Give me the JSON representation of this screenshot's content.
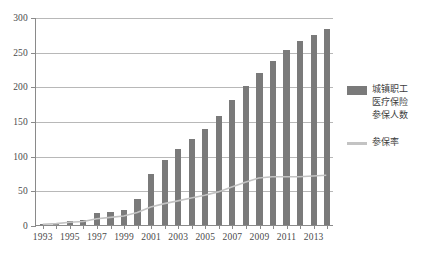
{
  "chart_data": {
    "type": "bar",
    "title": "",
    "subtitle": "",
    "xlabel": "",
    "ylabel": "",
    "ylim": [
      0,
      300
    ],
    "yticks": [
      0,
      50,
      100,
      150,
      200,
      250,
      300
    ],
    "ytick_labels": [
      "0",
      "50",
      "100",
      "150",
      "200",
      "250",
      "300"
    ],
    "grid": true,
    "legend_position": "right",
    "categories": [
      "1993",
      "1994",
      "1995",
      "1996",
      "1997",
      "1998",
      "1999",
      "2000",
      "2001",
      "2002",
      "2003",
      "2004",
      "2005",
      "2006",
      "2007",
      "2008",
      "2009",
      "2010",
      "2011",
      "2012",
      "2013",
      "2014"
    ],
    "xtick_labels_shown": [
      "1993",
      "1995",
      "1997",
      "1999",
      "2001",
      "2003",
      "2005",
      "2007",
      "2009",
      "2011",
      "2013"
    ],
    "series": [
      {
        "name": "城镇职工医疗保险参保人数",
        "type": "bar",
        "color": "#7a7a7a",
        "axis": "left",
        "values": [
          2,
          3,
          6,
          7,
          18,
          19,
          21,
          38,
          73,
          94,
          109,
          124,
          138,
          157,
          180,
          200,
          219,
          237,
          252,
          265,
          274,
          283
        ]
      },
      {
        "name": "参保率",
        "type": "line",
        "color": "#c3c3c3",
        "axis": "left",
        "values": [
          1,
          2,
          4,
          5,
          9,
          11,
          13,
          18,
          26,
          31,
          35,
          39,
          43,
          48,
          55,
          62,
          68,
          70,
          70,
          70,
          71,
          72
        ]
      }
    ]
  },
  "legend": {
    "items": [
      {
        "label": "城镇职工\n医疗保险\n参保人数",
        "swatch": "bar",
        "color": "#7a7a7a"
      },
      {
        "label": "参保率",
        "swatch": "line",
        "color": "#c3c3c3"
      }
    ]
  },
  "axes": {
    "y_axis_color": "#8a8a8a",
    "x_axis_color": "#8a8a8a",
    "gridline_color": "#b8b8b8"
  }
}
